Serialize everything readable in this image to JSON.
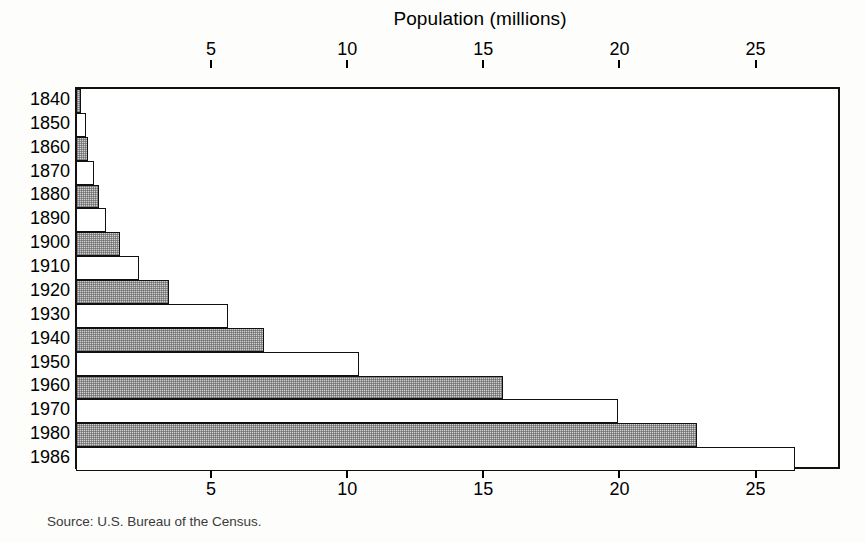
{
  "chart_data": {
    "type": "bar",
    "orientation": "horizontal",
    "title": "Population (millions)",
    "xlabel": "Population (millions)",
    "ylabel": "",
    "categories": [
      "1840",
      "1850",
      "1860",
      "1870",
      "1880",
      "1890",
      "1900",
      "1910",
      "1920",
      "1930",
      "1940",
      "1950",
      "1960",
      "1970",
      "1980",
      "1986"
    ],
    "values": [
      0.2,
      0.35,
      0.45,
      0.65,
      0.85,
      1.1,
      1.6,
      2.3,
      3.4,
      5.6,
      6.9,
      10.4,
      15.7,
      19.9,
      22.8,
      26.4
    ],
    "bar_styles": [
      "shaded",
      "plain",
      "shaded",
      "plain",
      "shaded",
      "plain",
      "shaded",
      "plain",
      "shaded",
      "plain",
      "shaded",
      "plain",
      "shaded",
      "plain",
      "shaded",
      "plain"
    ],
    "xlim": [
      0,
      28.1
    ],
    "xticks": [
      5,
      10,
      15,
      20,
      25
    ],
    "xtick_labels": [
      "5",
      "10",
      "15",
      "20",
      "25"
    ],
    "xticks_top": [
      5,
      10,
      15,
      20,
      25
    ],
    "xtick_labels_top": [
      "5",
      "10",
      "15",
      "20",
      "25"
    ],
    "grid": false,
    "legend": null,
    "source_note": "Source: U.S. Bureau of the Census."
  },
  "footer": {
    "source": "Source: U.S. Bureau of the Census."
  },
  "colors": {
    "axis": "#111111",
    "shaded_bar": "#cfcfcf",
    "plain_bar": "#ffffff",
    "background": "#fdfdfb",
    "text": "#000000"
  }
}
